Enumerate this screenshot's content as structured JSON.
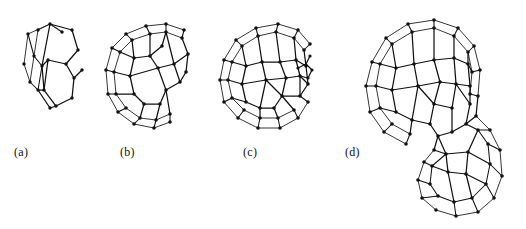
{
  "figure": {
    "background_color": "#ffffff",
    "ink_color": "#111111",
    "width": 526,
    "height": 229,
    "style": "line-drawing ball-and-stick wireframe, monochrome"
  },
  "panels": [
    {
      "id": "a",
      "caption": "(a)",
      "caption_x": 14,
      "caption_y": 145,
      "subject": "small curved polycyclic carbon fragment (corannulene-like nucleus)",
      "origin_x": 20,
      "origin_y": 12,
      "width": 76,
      "height": 112,
      "scale": 0.62,
      "vertex_radius": 1.7,
      "rings_visible": 4,
      "stage": "nucleation fragment"
    },
    {
      "id": "b",
      "caption": "(b)",
      "caption_x": 120,
      "caption_y": 145,
      "subject": "open hemispherical carbon bowl with notched rim",
      "origin_x": 100,
      "origin_y": 8,
      "width": 104,
      "height": 132,
      "scale": 0.86,
      "vertex_radius": 1.8,
      "rings_visible": 14,
      "stage": "bowl / partial cage"
    },
    {
      "id": "c",
      "caption": "(c)",
      "caption_x": 243,
      "caption_y": 145,
      "subject": "near-closed spherical fullerene cage with open patch on right",
      "origin_x": 214,
      "origin_y": 8,
      "width": 116,
      "height": 132,
      "scale": 1.0,
      "vertex_radius": 1.8,
      "rings_visible": 24,
      "stage": "closing cage"
    },
    {
      "id": "d",
      "caption": "(d)",
      "caption_x": 345,
      "caption_y": 145,
      "subject": "large fullerene cage with attached tubular carbon tail",
      "origin_x": 360,
      "origin_y": 4,
      "width": 156,
      "height": 218,
      "scale": 1.18,
      "vertex_radius": 1.8,
      "rings_visible": 42,
      "stage": "cage plus nanotube extension"
    }
  ]
}
